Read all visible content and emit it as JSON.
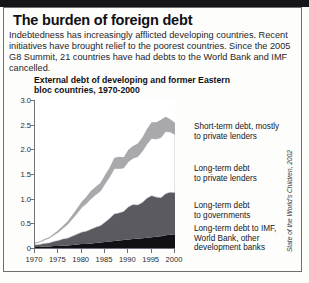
{
  "panel": {
    "title": "The burden of foreign debt",
    "standfirst": "Indebtedness has increasingly afflicted developing countries. Recent initiatives have brought relief to the poorest countries. Since the 2005 G8 Summit, 21 countries have had debts to the World Bank and IMF cancelled.",
    "source": "State of the World's Children, 2002"
  },
  "chart_data": {
    "type": "area",
    "title": "External debt of developing and former Eastern bloc countries, 1970-2000",
    "xlabel": "",
    "ylabel": "",
    "stacked": true,
    "grid": false,
    "legend_position": "right",
    "xlim": [
      1970,
      2000
    ],
    "ylim": [
      0,
      3.0
    ],
    "ytick_labels": [
      "3.0",
      "2.5",
      "2.0",
      "1.5",
      "1.0",
      "0.5",
      "0"
    ],
    "ytick_values": [
      3.0,
      2.5,
      2.0,
      1.5,
      1.0,
      0.5,
      0
    ],
    "xtick_labels": [
      "1970",
      "1975",
      "1980",
      "1985",
      "1990",
      "1995",
      "2000"
    ],
    "xtick_values": [
      1970,
      1975,
      1980,
      1985,
      1990,
      1995,
      2000
    ],
    "x": [
      1970,
      1971,
      1972,
      1973,
      1974,
      1975,
      1976,
      1977,
      1978,
      1979,
      1980,
      1981,
      1982,
      1983,
      1984,
      1985,
      1986,
      1987,
      1988,
      1989,
      1990,
      1991,
      1992,
      1993,
      1994,
      1995,
      1996,
      1997,
      1998,
      1999,
      2000
    ],
    "series": [
      {
        "name": "Long-term debt to IMF, World Bank, other development banks",
        "color": "#111115",
        "values": [
          0.02,
          0.02,
          0.03,
          0.03,
          0.04,
          0.04,
          0.05,
          0.05,
          0.06,
          0.07,
          0.08,
          0.08,
          0.09,
          0.1,
          0.11,
          0.12,
          0.13,
          0.14,
          0.15,
          0.16,
          0.17,
          0.18,
          0.19,
          0.2,
          0.21,
          0.22,
          0.23,
          0.24,
          0.26,
          0.27,
          0.28
        ]
      },
      {
        "name": "Long-term debt to governments",
        "color": "#5a5a60",
        "values": [
          0.04,
          0.05,
          0.06,
          0.07,
          0.09,
          0.11,
          0.13,
          0.15,
          0.18,
          0.21,
          0.24,
          0.26,
          0.29,
          0.32,
          0.34,
          0.4,
          0.47,
          0.55,
          0.56,
          0.58,
          0.66,
          0.7,
          0.68,
          0.72,
          0.8,
          0.84,
          0.8,
          0.78,
          0.84,
          0.86,
          0.84
        ]
      },
      {
        "name": "Long-term debt to private lenders",
        "color": "#ffffff",
        "values": [
          0.04,
          0.05,
          0.07,
          0.1,
          0.13,
          0.17,
          0.22,
          0.28,
          0.35,
          0.42,
          0.5,
          0.56,
          0.62,
          0.66,
          0.7,
          0.78,
          0.84,
          0.92,
          0.9,
          0.88,
          0.92,
          0.94,
          0.98,
          1.04,
          1.1,
          1.16,
          1.18,
          1.22,
          1.26,
          1.22,
          1.18
        ]
      },
      {
        "name": "Short-term debt, mostly to private lenders",
        "color": "#a9a9ad",
        "values": [
          0.01,
          0.01,
          0.02,
          0.02,
          0.03,
          0.04,
          0.05,
          0.06,
          0.08,
          0.1,
          0.12,
          0.14,
          0.16,
          0.16,
          0.17,
          0.18,
          0.19,
          0.22,
          0.24,
          0.22,
          0.24,
          0.25,
          0.27,
          0.28,
          0.3,
          0.33,
          0.34,
          0.36,
          0.3,
          0.26,
          0.24
        ]
      }
    ]
  },
  "legend": [
    {
      "label": "Short-term debt, mostly\nto private lenders"
    },
    {
      "label": "Long-term debt\nto private lenders"
    },
    {
      "label": "Long-term debt\nto governments"
    },
    {
      "label": "Long-term debt to IMF,\nWorld Bank, other\ndevelopment banks"
    }
  ]
}
